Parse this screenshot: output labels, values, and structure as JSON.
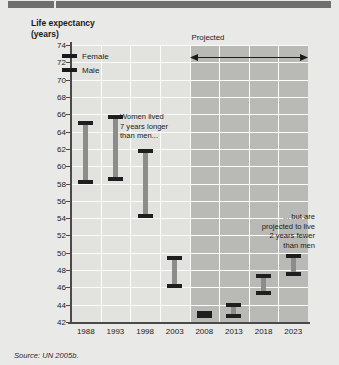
{
  "header": {
    "bars": [
      "header-bar-left",
      "header-bar-right"
    ]
  },
  "source_note": "Source: UN 2005b.",
  "colors": {
    "page_background": "#e9e9e7",
    "plot_background": "#e2e2df",
    "projected_band": "#b9b9b6",
    "gridline": "#fbfbfa",
    "axis": "#4a4a4a",
    "bar_stem": "#8c8c8a",
    "bar_cap": "#1f1f1f",
    "text": "#1b1b1b",
    "header_bar": "#6f6f70"
  },
  "chart_data": {
    "type": "bar",
    "title": "Life expectancy\n(years)",
    "xlabel": "",
    "ylabel": "Life expectancy (years)",
    "ylim": [
      42,
      74
    ],
    "ytick_step": 2,
    "yticks": [
      74,
      72,
      70,
      68,
      66,
      64,
      62,
      60,
      58,
      56,
      54,
      52,
      50,
      48,
      46,
      44,
      42
    ],
    "grid": true,
    "grid_orientation": "horizontal-and-vertical",
    "legend_position": "top-left",
    "categories": [
      "1988",
      "1993",
      "1998",
      "2003",
      "2008",
      "2013",
      "2018",
      "2023"
    ],
    "series": [
      {
        "name": "Female",
        "values": [
          65.0,
          65.7,
          61.8,
          49.4,
          43.1,
          42.7,
          45.3,
          47.5
        ]
      },
      {
        "name": "Male",
        "values": [
          58.2,
          58.5,
          54.2,
          46.2,
          42.7,
          44.0,
          47.3,
          49.6
        ]
      }
    ],
    "ranges": [
      {
        "category": "1988",
        "high": 65.0,
        "low": 58.2,
        "high_series": "Female",
        "low_series": "Male"
      },
      {
        "category": "1993",
        "high": 65.7,
        "low": 58.5,
        "high_series": "Female",
        "low_series": "Male"
      },
      {
        "category": "1998",
        "high": 61.8,
        "low": 54.2,
        "high_series": "Female",
        "low_series": "Male"
      },
      {
        "category": "2003",
        "high": 49.4,
        "low": 46.2,
        "high_series": "Female",
        "low_series": "Male"
      },
      {
        "category": "2008",
        "high": 43.1,
        "low": 42.7,
        "high_series": "Female",
        "low_series": "Male"
      },
      {
        "category": "2013",
        "high": 44.0,
        "low": 42.7,
        "high_series": "Male",
        "low_series": "Female"
      },
      {
        "category": "2018",
        "high": 47.3,
        "low": 45.3,
        "high_series": "Male",
        "low_series": "Female"
      },
      {
        "category": "2023",
        "high": 49.6,
        "low": 47.5,
        "high_series": "Male",
        "low_series": "Female"
      }
    ],
    "annotations": [
      {
        "id": "left",
        "text": "Women lived\n7 years longer\nthan men..."
      },
      {
        "id": "right",
        "text": "... but are\nprojected to live\n2 years fewer\nthan men"
      },
      {
        "id": "projected",
        "text": "Projected"
      }
    ],
    "projected_region": {
      "from": "2008",
      "to": "2023"
    }
  },
  "legend": {
    "items": [
      {
        "label": "Female",
        "color": "#1b1b1b"
      },
      {
        "label": "Male",
        "color": "#1b1b1b"
      }
    ]
  }
}
